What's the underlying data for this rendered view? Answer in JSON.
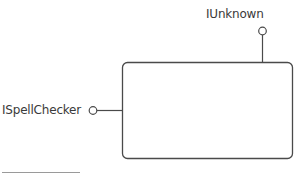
{
  "diagram": {
    "type": "com-component-interface-diagram",
    "component": {
      "label": "",
      "shape": "rounded-rectangle"
    },
    "interfaces": [
      {
        "name": "IUnknown",
        "position": "top"
      },
      {
        "name": "ISpellChecker",
        "position": "left"
      }
    ],
    "colors": {
      "stroke": "#4a4a4a",
      "text": "#3a3a3a",
      "background": "#ffffff"
    }
  }
}
